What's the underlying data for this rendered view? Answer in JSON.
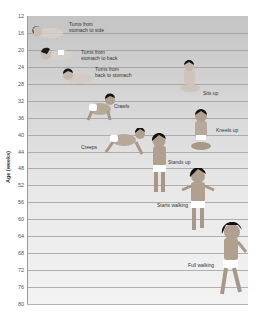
{
  "chart_data": {
    "type": "scatter",
    "title": "",
    "xlabel": "",
    "ylabel": "Age (weeks)",
    "ylim": [
      12,
      80
    ],
    "y_inverted": true,
    "grid": true,
    "yticks": [
      12,
      16,
      20,
      24,
      28,
      32,
      36,
      40,
      44,
      48,
      52,
      56,
      60,
      64,
      68,
      72,
      76,
      80
    ],
    "milestones": [
      {
        "label": "Turns from stomach to side",
        "age_weeks": 16
      },
      {
        "label": "Turns from stomach to back",
        "age_weeks": 21
      },
      {
        "label": "Turns from back to stomach",
        "age_weeks": 25
      },
      {
        "label": "Sits up",
        "age_weeks": 29
      },
      {
        "label": "Crawls",
        "age_weeks": 33
      },
      {
        "label": "Kneels up",
        "age_weeks": 39
      },
      {
        "label": "Creeps",
        "age_weeks": 41
      },
      {
        "label": "Stands up",
        "age_weeks": 46
      },
      {
        "label": "Starts walking",
        "age_weeks": 58
      },
      {
        "label": "Full walking",
        "age_weeks": 70
      }
    ],
    "colors": {
      "background_top": "#c4c4c4",
      "background_bottom": "#f3f3f3",
      "gridline": "#9a9a9a",
      "hair": "#1a1a1a",
      "skin": "#b8a89a",
      "diaper": "#ffffff"
    }
  },
  "labels": {
    "turns_side": "Turns from\nstomach to side",
    "turns_back": "Turns from\nstomach to back",
    "turns_stomach": "Turns from\nback to stomach",
    "sits_up": "Sits up",
    "crawls": "Crawls",
    "kneels_up": "Kneels up",
    "creeps": "Creeps",
    "stands_up": "Stands up",
    "starts_walking": "Starts walking",
    "full_walking": "Full walking"
  }
}
